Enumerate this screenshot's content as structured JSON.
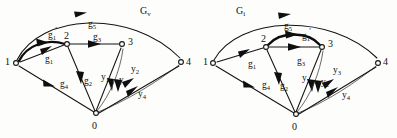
{
  "figure": {
    "background_color": "#fdfdfc",
    "ink_color": "#141414"
  },
  "graphs": [
    {
      "id": "Gv",
      "title_main": "G",
      "title_sub": "v",
      "nodes": [
        {
          "id": "1",
          "label": "1",
          "x": 16,
          "y": 63
        },
        {
          "id": "2",
          "label": "2",
          "x": 67,
          "y": 43
        },
        {
          "id": "3",
          "label": "3",
          "x": 122,
          "y": 44
        },
        {
          "id": "4",
          "label": "4",
          "x": 181,
          "y": 63
        },
        {
          "id": "0",
          "label": "0",
          "x": 96,
          "y": 114
        }
      ],
      "edges": [
        {
          "name": "g5",
          "from": "1",
          "to": "4",
          "label_main": "g",
          "label_sub": "5",
          "prime": false,
          "style": "arc-outer"
        },
        {
          "name": "g1prime",
          "from": "1",
          "to": "2",
          "label_main": "g",
          "label_sub": "1",
          "prime": true,
          "style": "arc-thick"
        },
        {
          "name": "g1",
          "from": "1",
          "to": "2",
          "label_main": "g",
          "label_sub": "1",
          "prime": false,
          "style": "straight"
        },
        {
          "name": "g3",
          "from": "2",
          "to": "3",
          "label_main": "g",
          "label_sub": "3",
          "prime": false,
          "style": "straight"
        },
        {
          "name": "g4",
          "from": "0",
          "to": "1",
          "label_main": "g",
          "label_sub": "4",
          "prime": false,
          "style": "straight"
        },
        {
          "name": "g2",
          "from": "0",
          "to": "2",
          "label_main": "g",
          "label_sub": "2",
          "prime": false,
          "style": "straight"
        },
        {
          "name": "y1",
          "from": "0",
          "to": "3",
          "label_main": "y",
          "label_sub": "1",
          "prime": false,
          "style": "straight"
        },
        {
          "name": "y3",
          "from": "0",
          "to": "3",
          "label_main": "y",
          "label_sub": "3",
          "prime": false,
          "style": "thin"
        },
        {
          "name": "y2",
          "from": "0",
          "to": "4",
          "label_main": "y",
          "label_sub": "2",
          "prime": false,
          "style": "thin"
        },
        {
          "name": "y4",
          "from": "0",
          "to": "4",
          "label_main": "y",
          "label_sub": "4",
          "prime": false,
          "style": "straight"
        }
      ],
      "edge_labels": [
        {
          "name": "g5",
          "main": "g",
          "sub": "5",
          "prime": false,
          "x": 88,
          "y": 20
        },
        {
          "name": "g1prime",
          "main": "g",
          "sub": "1",
          "prime": true,
          "x": 48,
          "y": 30
        },
        {
          "name": "g1",
          "main": "g",
          "sub": "1",
          "prime": false,
          "x": 45,
          "y": 56
        },
        {
          "name": "g3",
          "main": "g",
          "sub": "3",
          "prime": false,
          "x": 93,
          "y": 34
        },
        {
          "name": "g4",
          "main": "g",
          "sub": "4",
          "prime": false,
          "x": 60,
          "y": 81
        },
        {
          "name": "g2",
          "main": "g",
          "sub": "2",
          "prime": false,
          "x": 84,
          "y": 78
        },
        {
          "name": "y1",
          "main": "y",
          "sub": "1",
          "prime": false,
          "x": 102,
          "y": 74
        },
        {
          "name": "y3",
          "main": "y",
          "sub": "3",
          "prime": false,
          "x": 120,
          "y": 77
        },
        {
          "name": "y2",
          "main": "y",
          "sub": "2",
          "prime": false,
          "x": 131,
          "y": 67
        },
        {
          "name": "y4",
          "main": "y",
          "sub": "4",
          "prime": false,
          "x": 139,
          "y": 91
        }
      ]
    },
    {
      "id": "Gi",
      "title_main": "G",
      "title_sub": "i",
      "nodes": [
        {
          "id": "1",
          "label": "1",
          "x": 213,
          "y": 63
        },
        {
          "id": "2",
          "label": "2",
          "x": 266,
          "y": 46
        },
        {
          "id": "3",
          "label": "3",
          "x": 322,
          "y": 46
        },
        {
          "id": "4",
          "label": "4",
          "x": 378,
          "y": 63
        },
        {
          "id": "0",
          "label": "0",
          "x": 296,
          "y": 115
        }
      ],
      "edges": [
        {
          "name": "g5",
          "from": "1",
          "to": "4",
          "label_main": "g",
          "label_sub": "5",
          "prime": false,
          "style": "arc-outer"
        },
        {
          "name": "g1",
          "from": "1",
          "to": "2",
          "label_main": "g",
          "label_sub": "1",
          "prime": false,
          "style": "straight"
        },
        {
          "name": "g1prime",
          "from": "2",
          "to": "3",
          "label_main": "g",
          "label_sub": "1",
          "prime": true,
          "style": "arc-thick"
        },
        {
          "name": "g3",
          "from": "2",
          "to": "3",
          "label_main": "g",
          "label_sub": "3",
          "prime": false,
          "style": "straight"
        },
        {
          "name": "g4",
          "from": "0",
          "to": "1",
          "label_main": "g",
          "label_sub": "4",
          "prime": false,
          "style": "straight"
        },
        {
          "name": "g2",
          "from": "0",
          "to": "2",
          "label_main": "g",
          "label_sub": "2",
          "prime": false,
          "style": "straight"
        },
        {
          "name": "y1",
          "from": "0",
          "to": "3",
          "label_main": "y",
          "label_sub": "1",
          "prime": false,
          "style": "straight"
        },
        {
          "name": "y2",
          "from": "0",
          "to": "3",
          "label_main": "y",
          "label_sub": "2",
          "prime": false,
          "style": "thin"
        },
        {
          "name": "y3",
          "from": "0",
          "to": "4",
          "label_main": "y",
          "label_sub": "3",
          "prime": false,
          "style": "thin"
        },
        {
          "name": "y4",
          "from": "0",
          "to": "4",
          "label_main": "y",
          "label_sub": "4",
          "prime": false,
          "style": "straight"
        }
      ],
      "edge_labels": [
        {
          "name": "g5",
          "main": "g",
          "sub": "5",
          "prime": false,
          "x": 284,
          "y": 22
        },
        {
          "name": "g1prime",
          "main": "g",
          "sub": "1",
          "prime": true,
          "x": 302,
          "y": 30
        },
        {
          "name": "g1",
          "main": "g",
          "sub": "1",
          "prime": false,
          "x": 248,
          "y": 61
        },
        {
          "name": "g3",
          "main": "g",
          "sub": "3",
          "prime": false,
          "x": 297,
          "y": 58
        },
        {
          "name": "g4",
          "main": "g",
          "sub": "4",
          "prime": false,
          "x": 263,
          "y": 82
        },
        {
          "name": "g2",
          "main": "g",
          "sub": "2",
          "prime": false,
          "x": 280,
          "y": 83
        },
        {
          "name": "y1",
          "main": "y",
          "sub": "1",
          "prime": false,
          "x": 303,
          "y": 75
        },
        {
          "name": "y2",
          "main": "y",
          "sub": "2",
          "prime": false,
          "x": 322,
          "y": 79
        },
        {
          "name": "y3",
          "main": "y",
          "sub": "3",
          "prime": false,
          "x": 334,
          "y": 68
        },
        {
          "name": "y4",
          "main": "y",
          "sub": "4",
          "prime": false,
          "x": 343,
          "y": 92
        }
      ]
    }
  ],
  "titles": [
    {
      "name": "graph-title-Gv",
      "main": "G",
      "sub": "v",
      "x": 140,
      "y": 6
    },
    {
      "name": "graph-title-Gi",
      "main": "G",
      "sub": "i",
      "x": 236,
      "y": 6
    }
  ],
  "node_labels": [
    {
      "name": "node-label-Gv-1",
      "text": "1",
      "x": 5,
      "y": 57
    },
    {
      "name": "node-label-Gv-2",
      "text": "2",
      "x": 64,
      "y": 31
    },
    {
      "name": "node-label-Gv-3",
      "text": "3",
      "x": 128,
      "y": 37
    },
    {
      "name": "node-label-Gv-4",
      "text": "4",
      "x": 186,
      "y": 57
    },
    {
      "name": "node-label-Gv-0",
      "text": "0",
      "x": 92,
      "y": 121
    },
    {
      "name": "node-label-Gi-1",
      "text": "1",
      "x": 203,
      "y": 57
    },
    {
      "name": "node-label-Gi-2",
      "text": "2",
      "x": 262,
      "y": 34
    },
    {
      "name": "node-label-Gi-3",
      "text": "3",
      "x": 328,
      "y": 39
    },
    {
      "name": "node-label-Gi-4",
      "text": "4",
      "x": 383,
      "y": 57
    },
    {
      "name": "node-label-Gi-0",
      "text": "0",
      "x": 292,
      "y": 122
    }
  ]
}
